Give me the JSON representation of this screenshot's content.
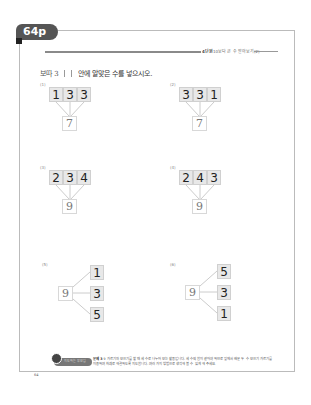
{
  "page_tab": "64p",
  "header": {
    "chapter": "4단원",
    "subtitle": "10보다 큰 수 알아보기(2)"
  },
  "question": {
    "number": "보따 3",
    "text": "안에 알맞은 수를 넣으시오."
  },
  "problems": [
    {
      "label": "(1)",
      "parts": [
        "1",
        "3",
        "3"
      ],
      "total": "7",
      "layout": "top"
    },
    {
      "label": "(2)",
      "parts": [
        "3",
        "3",
        "1"
      ],
      "total": "7",
      "layout": "top"
    },
    {
      "label": "(3)",
      "parts": [
        "2",
        "3",
        "4"
      ],
      "total": "9",
      "layout": "top"
    },
    {
      "label": "(4)",
      "parts": [
        "2",
        "4",
        "3"
      ],
      "total": "9",
      "layout": "top"
    },
    {
      "label": "(5)",
      "parts": [
        "1",
        "3",
        "5"
      ],
      "total": "9",
      "layout": "side"
    },
    {
      "label": "(6)",
      "parts": [
        "5",
        "3",
        "1"
      ],
      "total": "9",
      "layout": "side"
    }
  ],
  "footer": {
    "badge": "지도하는 부모님",
    "note_label": "문제 3",
    "note_text": "9 가르기와 모으기를 할 때 세 수로 나누어 보는 활동입니다. 세 수의 합이 같아야 하므로 앞에서 배운 두 수 모으기 가르기를 이용하여 차례로 해결하도록 지도합니다. 여러 가지 방법으로 생각해 볼 수 있게 해 주세요.",
    "page_number": "64"
  }
}
